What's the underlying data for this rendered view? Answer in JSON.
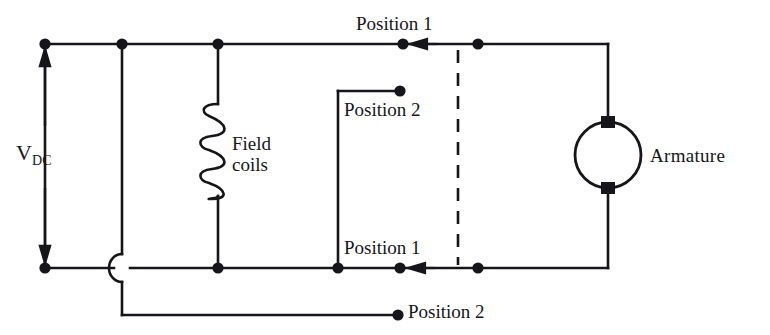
{
  "diagram": {
    "type": "schematic",
    "background_color": "#ffffff",
    "ink_color": "#16161a"
  },
  "labels": {
    "supply": {
      "text_main": "V",
      "text_sub": "DC",
      "full": "V_DC"
    },
    "field_coils_line1": "Field",
    "field_coils_line2": "coils",
    "armature": "Armature",
    "position_1_top": "Position 1",
    "position_2_top": "Position 2",
    "position_1_bottom": "Position 1",
    "position_2_bottom": "Position 2"
  },
  "components": [
    {
      "name": "dc-supply",
      "kind": "voltage-source",
      "label": "V_DC",
      "orientation": "vertical",
      "x": 45,
      "y_top": 44,
      "y_bottom": 268
    },
    {
      "name": "field-coils",
      "kind": "inductor",
      "label": "Field coils",
      "loops": 5,
      "x": 218,
      "y_top": 44,
      "y_bottom": 268
    },
    {
      "name": "armature",
      "kind": "motor-armature",
      "label": "Armature",
      "cx": 608,
      "cy": 155,
      "r": 33,
      "brushes": 2
    },
    {
      "name": "switch-linkage",
      "kind": "dashed-mechanical-link",
      "x": 458,
      "y_top": 50,
      "y_bottom": 265
    }
  ],
  "terminals": [
    {
      "name": "node-supply-top",
      "x": 45,
      "y": 44
    },
    {
      "name": "node-branch-top",
      "x": 122,
      "y": 44
    },
    {
      "name": "node-field-top",
      "x": 218,
      "y": 44
    },
    {
      "name": "node-position-1-top",
      "x": 403,
      "y": 44
    },
    {
      "name": "node-link-top",
      "x": 478,
      "y": 44
    },
    {
      "name": "node-position-2-top",
      "x": 400,
      "y": 91
    },
    {
      "name": "node-supply-bottom",
      "x": 45,
      "y": 268
    },
    {
      "name": "node-field-bottom",
      "x": 218,
      "y": 268
    },
    {
      "name": "node-switchbox-bottom",
      "x": 338,
      "y": 268
    },
    {
      "name": "node-position-1-bottom",
      "x": 400,
      "y": 268
    },
    {
      "name": "node-link-bottom",
      "x": 478,
      "y": 268
    },
    {
      "name": "node-position-2-bottom",
      "x": 398,
      "y": 312
    }
  ],
  "arrows": [
    {
      "name": "supply-arrow-up",
      "direction": "up",
      "x": 45,
      "from_y": 120,
      "to_y": 52
    },
    {
      "name": "supply-arrow-down",
      "direction": "down",
      "x": 45,
      "from_y": 190,
      "to_y": 262
    },
    {
      "name": "current-arrow-top",
      "direction": "left",
      "y": 44,
      "from_x": 440,
      "to_x": 412
    },
    {
      "name": "current-arrow-bottom",
      "direction": "left",
      "y": 268,
      "from_x": 438,
      "to_x": 410
    }
  ],
  "wires": [
    {
      "name": "top-rail",
      "points": "45,44 608,44"
    },
    {
      "name": "bottom-rail",
      "points": "45,268 608,268"
    },
    {
      "name": "left-supply-leg",
      "points": "45,44 45,268"
    },
    {
      "name": "branch-vertical",
      "points": "122,44 122,315"
    },
    {
      "name": "bottom-position-2-lead",
      "points": "122,315 398,315"
    },
    {
      "name": "field-leg",
      "points": "218,44 218,268"
    },
    {
      "name": "switchbox-left",
      "points": "338,91 338,268"
    },
    {
      "name": "switchbox-top",
      "points": "338,91 400,91"
    },
    {
      "name": "armature-top-lead",
      "points": "608,44 608,122"
    },
    {
      "name": "armature-bottom-lead",
      "points": "608,188 608,268"
    }
  ],
  "crossings": [
    {
      "name": "wire-hop",
      "x": 122,
      "y": 268,
      "style": "semicircle-left"
    }
  ]
}
